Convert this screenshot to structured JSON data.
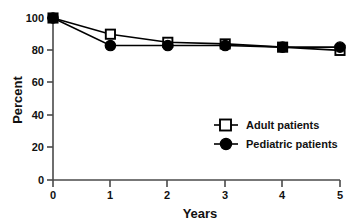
{
  "chart_data": {
    "type": "line",
    "title": "",
    "subtitle": "",
    "xlabel": "Years",
    "ylabel": "Percent",
    "x": [
      0,
      1,
      2,
      3,
      4,
      5
    ],
    "xlim": [
      0,
      5
    ],
    "ylim": [
      0,
      100
    ],
    "xticks": [
      "0",
      "1",
      "2",
      "3",
      "4",
      "5"
    ],
    "yticks": [
      "0",
      "20",
      "40",
      "60",
      "80",
      "100"
    ],
    "grid": false,
    "legend_position": "center-right",
    "series": [
      {
        "name": "Adult patients",
        "marker": "open-square",
        "values": [
          100,
          90,
          85,
          84,
          82,
          80
        ]
      },
      {
        "name": "Pediatric patients",
        "marker": "filled-circle",
        "values": [
          100,
          83,
          83,
          83,
          82,
          82
        ]
      }
    ]
  },
  "axes": {
    "y_title": "Percent",
    "x_title": "Years",
    "y_tick_labels": [
      "100",
      "80",
      "60",
      "40",
      "20",
      "0"
    ],
    "x_tick_labels": [
      "0",
      "1",
      "2",
      "3",
      "4",
      "5"
    ]
  },
  "legend": {
    "entries": [
      {
        "label": "Adult patients",
        "marker": "open-square"
      },
      {
        "label": "Pediatric patients",
        "marker": "filled-circle"
      }
    ]
  },
  "colors": {
    "line": "#000000",
    "marker_fill_open": "#ffffff",
    "marker_fill_solid": "#000000",
    "axis": "#4a4a4a",
    "text": "#111111",
    "background": "#ffffff"
  },
  "caption": {
    "clipped_text": ""
  }
}
